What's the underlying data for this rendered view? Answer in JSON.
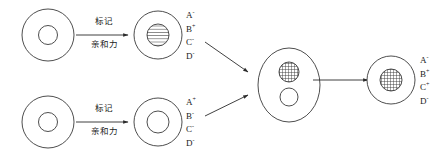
{
  "diagram": {
    "stroke_color": "#3a3a3a",
    "text_color": "#1a1a1a",
    "background": "#ffffff"
  },
  "arrow_labels": {
    "top": {
      "above": "标记",
      "below": "亲和力"
    },
    "bottom": {
      "above": "标记",
      "below": "亲和力"
    }
  },
  "markers": {
    "top_cell": [
      {
        "letter": "A",
        "sign": "-"
      },
      {
        "letter": "B",
        "sign": "+"
      },
      {
        "letter": "C",
        "sign": "-"
      },
      {
        "letter": "D",
        "sign": "-"
      }
    ],
    "bottom_cell": [
      {
        "letter": "A",
        "sign": "+"
      },
      {
        "letter": "B",
        "sign": "-"
      },
      {
        "letter": "C",
        "sign": "-"
      },
      {
        "letter": "D",
        "sign": "-"
      }
    ],
    "final_cell": [
      {
        "letter": "A",
        "sign": "-"
      },
      {
        "letter": "B",
        "sign": "+"
      },
      {
        "letter": "C",
        "sign": "+"
      },
      {
        "letter": "D",
        "sign": "-"
      }
    ]
  },
  "cells": {
    "top_left": {
      "nucleus_fill": "plain",
      "shape": "circle"
    },
    "top_labeled": {
      "nucleus_fill": "striped",
      "shape": "circle"
    },
    "bottom_left": {
      "nucleus_fill": "plain",
      "shape": "circle"
    },
    "bottom_labeled": {
      "nucleus_fill": "plain",
      "shape": "circle"
    },
    "hybrid": {
      "nucleus_fill": "grid-and-plain",
      "shape": "ellipse",
      "nuclei_count": 2
    },
    "final": {
      "nucleus_fill": "grid",
      "shape": "circle"
    }
  }
}
